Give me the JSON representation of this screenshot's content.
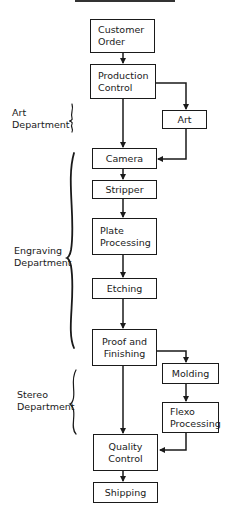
{
  "diagram": {
    "type": "flowchart",
    "nodes": [
      {
        "id": "customer_order",
        "label": "Customer\nOrder"
      },
      {
        "id": "production_control",
        "label": "Production\nControl"
      },
      {
        "id": "art",
        "label": "Art"
      },
      {
        "id": "camera",
        "label": "Camera"
      },
      {
        "id": "stripper",
        "label": "Stripper"
      },
      {
        "id": "plate_processing",
        "label": "Plate\nProcessing"
      },
      {
        "id": "etching",
        "label": "Etching"
      },
      {
        "id": "proof_finishing",
        "label": "Proof and\nFinishing"
      },
      {
        "id": "molding",
        "label": "Molding"
      },
      {
        "id": "flexo_processing",
        "label": "Flexo\nProcessing"
      },
      {
        "id": "quality_control",
        "label": "Quality\nControl"
      },
      {
        "id": "shipping",
        "label": "Shipping"
      }
    ],
    "edges": [
      {
        "from": "customer_order",
        "to": "production_control"
      },
      {
        "from": "production_control",
        "to": "camera"
      },
      {
        "from": "production_control",
        "to": "art"
      },
      {
        "from": "art",
        "to": "camera"
      },
      {
        "from": "camera",
        "to": "stripper"
      },
      {
        "from": "stripper",
        "to": "plate_processing"
      },
      {
        "from": "plate_processing",
        "to": "etching"
      },
      {
        "from": "etching",
        "to": "proof_finishing"
      },
      {
        "from": "proof_finishing",
        "to": "quality_control"
      },
      {
        "from": "proof_finishing",
        "to": "molding"
      },
      {
        "from": "molding",
        "to": "flexo_processing"
      },
      {
        "from": "flexo_processing",
        "to": "quality_control"
      },
      {
        "from": "quality_control",
        "to": "shipping"
      }
    ],
    "departments": [
      {
        "label": "Art\nDepartment",
        "spans": [
          "art"
        ]
      },
      {
        "label": "Engraving\nDepartment",
        "spans": [
          "camera",
          "stripper",
          "plate_processing",
          "etching",
          "proof_finishing"
        ]
      },
      {
        "label": "Stereo\nDepartment",
        "spans": [
          "molding",
          "flexo_processing"
        ]
      }
    ]
  }
}
